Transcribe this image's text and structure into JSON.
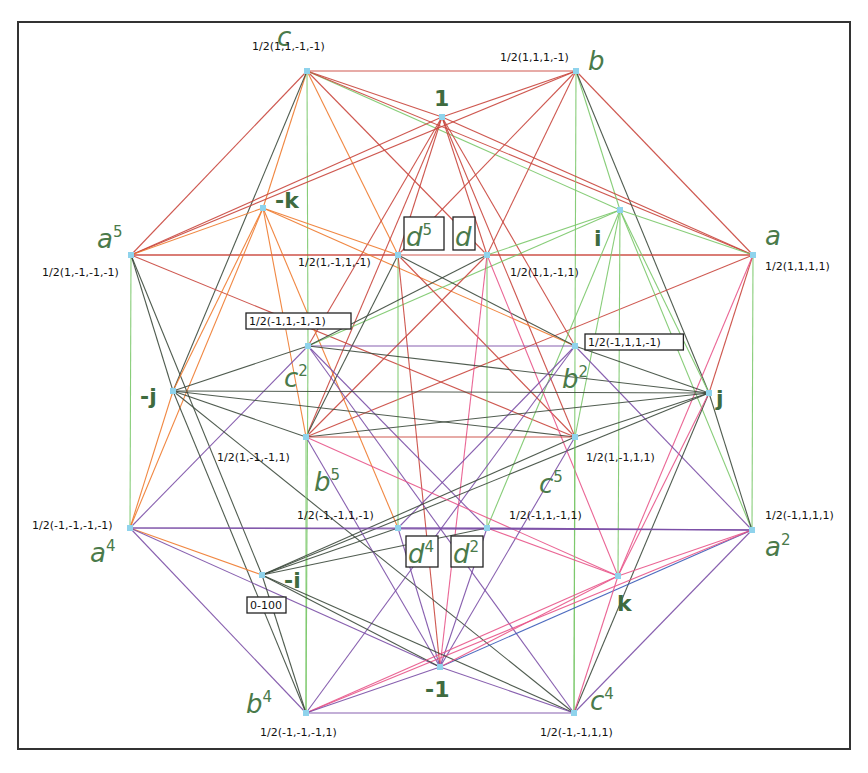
{
  "diagram": {
    "title": "",
    "frame": {
      "x": 18,
      "y": 22,
      "w": 832,
      "h": 727
    },
    "colors": {
      "node": "#8fd3ec",
      "label_green": "#4a7a4a",
      "red": "#c9463d",
      "orange": "#ee7a2e",
      "green": "#7bc86a",
      "dark": "#3d4a3d",
      "purple": "#7b4fa6",
      "pink": "#e8558a",
      "blue": "#3a5bb8",
      "brown": "#8a4a3a"
    },
    "nodes": [
      {
        "id": "c",
        "x": 307,
        "y": 71,
        "symbol": "c",
        "sup": "",
        "coord": "1/2(1,1,-1,-1)",
        "sx": 277,
        "sy": 46,
        "cx": 252,
        "cy": 50,
        "bold": false,
        "boxed": false
      },
      {
        "id": "b",
        "x": 576,
        "y": 71,
        "symbol": "b",
        "sup": "",
        "coord": "1/2(1,1,1,-1)",
        "sx": 588,
        "sy": 70,
        "cx": 500,
        "cy": 61,
        "bold": false,
        "boxed": false
      },
      {
        "id": "one",
        "x": 442,
        "y": 117,
        "symbol": "1",
        "sup": "",
        "coord": "",
        "sx": 434,
        "sy": 106,
        "cx": 0,
        "cy": 0,
        "bold": true,
        "boxed": false
      },
      {
        "id": "a5",
        "x": 131,
        "y": 255,
        "symbol": "a",
        "sup": "5",
        "coord": "1/2(1,-1,-1,-1)",
        "sx": 97,
        "sy": 248,
        "cx": 42,
        "cy": 276,
        "bold": false,
        "boxed": false
      },
      {
        "id": "a",
        "x": 753,
        "y": 255,
        "symbol": "a",
        "sup": "",
        "coord": "1/2(1,1,1,1)",
        "sx": 765,
        "sy": 245,
        "cx": 765,
        "cy": 270,
        "bold": false,
        "boxed": false
      },
      {
        "id": "nk",
        "x": 263,
        "y": 208,
        "symbol": "-k",
        "sup": "",
        "coord": "",
        "sx": 275,
        "sy": 208,
        "cx": 0,
        "cy": 0,
        "bold": true,
        "boxed": false
      },
      {
        "id": "i",
        "x": 620,
        "y": 210,
        "symbol": "i",
        "sup": "",
        "coord": "",
        "sx": 594,
        "sy": 246,
        "cx": 0,
        "cy": 0,
        "bold": true,
        "boxed": false
      },
      {
        "id": "d5",
        "x": 398,
        "y": 255,
        "symbol": "d",
        "sup": "5",
        "coord": "1/2(1,-1,1,-1)",
        "sx": 406,
        "sy": 246,
        "cx": 298,
        "cy": 266,
        "bold": false,
        "boxed": true,
        "bx": 404,
        "by": 217,
        "bw": 40,
        "bh": 33
      },
      {
        "id": "d",
        "x": 487,
        "y": 255,
        "symbol": "d",
        "sup": "",
        "coord": "1/2(1,1,-1,1)",
        "sx": 455,
        "sy": 246,
        "cx": 510,
        "cy": 276,
        "bold": false,
        "boxed": true,
        "bx": 453,
        "by": 217,
        "bw": 22,
        "bh": 33
      },
      {
        "id": "c2",
        "x": 308,
        "y": 346,
        "symbol": "c",
        "sup": "2",
        "coord": "1/2(-1,1,-1,-1)",
        "sx": 284,
        "sy": 387,
        "cx": 249,
        "cy": 325,
        "bold": false,
        "boxed": false,
        "coord_boxed": true
      },
      {
        "id": "b2",
        "x": 575,
        "y": 346,
        "symbol": "b",
        "sup": "2",
        "coord": "1/2(-1,1,1,-1)",
        "sx": 562,
        "sy": 388,
        "cx": 588,
        "cy": 346,
        "bold": false,
        "boxed": false,
        "coord_boxed": true
      },
      {
        "id": "nj",
        "x": 173,
        "y": 391,
        "symbol": "-j",
        "sup": "",
        "coord": "",
        "sx": 140,
        "sy": 404,
        "cx": 0,
        "cy": 0,
        "bold": true,
        "boxed": false
      },
      {
        "id": "j",
        "x": 709,
        "y": 393,
        "symbol": "j",
        "sup": "",
        "coord": "",
        "sx": 716,
        "sy": 406,
        "cx": 0,
        "cy": 0,
        "bold": true,
        "boxed": false
      },
      {
        "id": "b5",
        "x": 306,
        "y": 437,
        "symbol": "b",
        "sup": "5",
        "coord": "1/2(1,-1,-1,1)",
        "sx": 314,
        "sy": 491,
        "cx": 217,
        "cy": 461,
        "bold": false,
        "boxed": false
      },
      {
        "id": "c5",
        "x": 575,
        "y": 437,
        "symbol": "c",
        "sup": "5",
        "coord": "1/2(1,-1,1,1)",
        "sx": 539,
        "sy": 493,
        "cx": 586,
        "cy": 461,
        "bold": false,
        "boxed": false
      },
      {
        "id": "d4",
        "x": 398,
        "y": 528,
        "symbol": "d",
        "sup": "4",
        "coord": "1/2(-1,-1,1,-1)",
        "sx": 408,
        "sy": 563,
        "cx": 297,
        "cy": 519,
        "bold": false,
        "boxed": true,
        "bx": 406,
        "by": 536,
        "bw": 32,
        "bh": 31
      },
      {
        "id": "d2",
        "x": 487,
        "y": 528,
        "symbol": "d",
        "sup": "2",
        "coord": "1/2(-1,1,-1,1)",
        "sx": 453,
        "sy": 563,
        "cx": 509,
        "cy": 519,
        "bold": false,
        "boxed": true,
        "bx": 451,
        "by": 536,
        "bw": 32,
        "bh": 31
      },
      {
        "id": "a4",
        "x": 130,
        "y": 528,
        "symbol": "a",
        "sup": "4",
        "coord": "1/2(-1,-1,-1,-1)",
        "sx": 90,
        "sy": 562,
        "cx": 32,
        "cy": 529,
        "bold": false,
        "boxed": false
      },
      {
        "id": "a2",
        "x": 752,
        "y": 530,
        "symbol": "a",
        "sup": "2",
        "coord": "1/2(-1,1,1,1)",
        "sx": 765,
        "sy": 556,
        "cx": 765,
        "cy": 519,
        "bold": false,
        "boxed": false
      },
      {
        "id": "ni",
        "x": 262,
        "y": 575,
        "symbol": "-i",
        "sup": "",
        "coord": "0-100",
        "sx": 284,
        "sy": 588,
        "cx": 250,
        "cy": 609,
        "bold": true,
        "boxed": false,
        "coord_boxed": true
      },
      {
        "id": "k",
        "x": 618,
        "y": 576,
        "symbol": "k",
        "sup": "",
        "coord": "",
        "sx": 617,
        "sy": 611,
        "cx": 0,
        "cy": 0,
        "bold": true,
        "boxed": false
      },
      {
        "id": "n1",
        "x": 440,
        "y": 667,
        "symbol": "-1",
        "sup": "",
        "coord": "",
        "sx": 425,
        "sy": 697,
        "cx": 0,
        "cy": 0,
        "bold": true,
        "boxed": false
      },
      {
        "id": "b4",
        "x": 306,
        "y": 713,
        "symbol": "b",
        "sup": "4",
        "coord": "1/2(-1,-1,-1,1)",
        "sx": 246,
        "sy": 713,
        "cx": 260,
        "cy": 736,
        "bold": false,
        "boxed": false
      },
      {
        "id": "c4",
        "x": 574,
        "y": 713,
        "symbol": "c",
        "sup": "4",
        "coord": "1/2(-1,-1,1,1)",
        "sx": 590,
        "sy": 710,
        "cx": 540,
        "cy": 736,
        "bold": false,
        "boxed": false
      }
    ],
    "edges": [
      [
        "c",
        "b",
        "red"
      ],
      [
        "c",
        "one",
        "red"
      ],
      [
        "c",
        "a5",
        "red"
      ],
      [
        "c",
        "nk",
        "orange"
      ],
      [
        "c",
        "c2",
        "green"
      ],
      [
        "c",
        "i",
        "green"
      ],
      [
        "c",
        "a",
        "red"
      ],
      [
        "c",
        "d",
        "red"
      ],
      [
        "c",
        "nj",
        "dark"
      ],
      [
        "c",
        "d5",
        "orange"
      ],
      [
        "b",
        "one",
        "red"
      ],
      [
        "b",
        "a",
        "red"
      ],
      [
        "b",
        "i",
        "green"
      ],
      [
        "b",
        "b2",
        "green"
      ],
      [
        "b",
        "j",
        "dark"
      ],
      [
        "b",
        "a5",
        "red"
      ],
      [
        "b",
        "d5",
        "red"
      ],
      [
        "b",
        "d",
        "red"
      ],
      [
        "one",
        "a5",
        "red"
      ],
      [
        "one",
        "a",
        "red"
      ],
      [
        "one",
        "d5",
        "red"
      ],
      [
        "one",
        "d",
        "red"
      ],
      [
        "one",
        "c2",
        "red"
      ],
      [
        "one",
        "b2",
        "red"
      ],
      [
        "one",
        "b5",
        "red"
      ],
      [
        "one",
        "c5",
        "red"
      ],
      [
        "a5",
        "a",
        "red"
      ],
      [
        "a5",
        "nk",
        "orange"
      ],
      [
        "a5",
        "a4",
        "green"
      ],
      [
        "a5",
        "nj",
        "dark"
      ],
      [
        "a5",
        "ni",
        "dark"
      ],
      [
        "a5",
        "c5",
        "red"
      ],
      [
        "a5",
        "d5",
        "red"
      ],
      [
        "a",
        "i",
        "green"
      ],
      [
        "a",
        "a2",
        "green"
      ],
      [
        "a",
        "j",
        "red"
      ],
      [
        "a",
        "k",
        "pink"
      ],
      [
        "a",
        "b5",
        "red"
      ],
      [
        "a",
        "d",
        "red"
      ],
      [
        "nk",
        "b2",
        "orange"
      ],
      [
        "nk",
        "d5",
        "orange"
      ],
      [
        "nk",
        "nj",
        "orange"
      ],
      [
        "nk",
        "a4",
        "orange"
      ],
      [
        "nk",
        "d4",
        "orange"
      ],
      [
        "nk",
        "b5",
        "orange"
      ],
      [
        "i",
        "c2",
        "green"
      ],
      [
        "i",
        "d",
        "green"
      ],
      [
        "i",
        "j",
        "green"
      ],
      [
        "i",
        "a2",
        "green"
      ],
      [
        "i",
        "k",
        "green"
      ],
      [
        "i",
        "c5",
        "green"
      ],
      [
        "i",
        "d2",
        "green"
      ],
      [
        "d5",
        "b2",
        "dark"
      ],
      [
        "d5",
        "c5",
        "red"
      ],
      [
        "d5",
        "d4",
        "green"
      ],
      [
        "d5",
        "b5",
        "dark"
      ],
      [
        "d5",
        "n1",
        "red"
      ],
      [
        "d",
        "c2",
        "dark"
      ],
      [
        "d",
        "b5",
        "red"
      ],
      [
        "d",
        "d2",
        "green"
      ],
      [
        "d",
        "n1",
        "pink"
      ],
      [
        "d",
        "k",
        "pink"
      ],
      [
        "c2",
        "b2",
        "purple"
      ],
      [
        "c2",
        "nj",
        "dark"
      ],
      [
        "c2",
        "j",
        "dark"
      ],
      [
        "c2",
        "b4",
        "green"
      ],
      [
        "c2",
        "d2",
        "purple"
      ],
      [
        "c2",
        "a4",
        "purple"
      ],
      [
        "c2",
        "c4",
        "purple"
      ],
      [
        "b2",
        "j",
        "dark"
      ],
      [
        "b2",
        "c4",
        "green"
      ],
      [
        "b2",
        "d4",
        "purple"
      ],
      [
        "b2",
        "a2",
        "purple"
      ],
      [
        "b2",
        "b4",
        "purple"
      ],
      [
        "nj",
        "j",
        "dark"
      ],
      [
        "nj",
        "b5",
        "dark"
      ],
      [
        "nj",
        "c5",
        "dark"
      ],
      [
        "nj",
        "a4",
        "orange"
      ],
      [
        "nj",
        "c4",
        "dark"
      ],
      [
        "nj",
        "b4",
        "dark"
      ],
      [
        "j",
        "b5",
        "dark"
      ],
      [
        "j",
        "c5",
        "dark"
      ],
      [
        "j",
        "a2",
        "dark"
      ],
      [
        "j",
        "ni",
        "dark"
      ],
      [
        "j",
        "c4",
        "dark"
      ],
      [
        "j",
        "k",
        "pink"
      ],
      [
        "b5",
        "c5",
        "red"
      ],
      [
        "b5",
        "b4",
        "green"
      ],
      [
        "b5",
        "k",
        "pink"
      ],
      [
        "b5",
        "n1",
        "purple"
      ],
      [
        "c5",
        "c4",
        "green"
      ],
      [
        "c5",
        "ni",
        "dark"
      ],
      [
        "c5",
        "n1",
        "purple"
      ],
      [
        "d4",
        "d2",
        "purple"
      ],
      [
        "d4",
        "a4",
        "purple"
      ],
      [
        "d4",
        "ni",
        "dark"
      ],
      [
        "d4",
        "n1",
        "purple"
      ],
      [
        "d4",
        "a2",
        "purple"
      ],
      [
        "d2",
        "a2",
        "purple"
      ],
      [
        "d2",
        "k",
        "pink"
      ],
      [
        "d2",
        "n1",
        "purple"
      ],
      [
        "d2",
        "ni",
        "dark"
      ],
      [
        "a4",
        "ni",
        "orange"
      ],
      [
        "a4",
        "b4",
        "purple"
      ],
      [
        "a4",
        "n1",
        "purple"
      ],
      [
        "a4",
        "a2",
        "purple"
      ],
      [
        "a2",
        "k",
        "pink"
      ],
      [
        "a2",
        "n1",
        "blue"
      ],
      [
        "a2",
        "c4",
        "purple"
      ],
      [
        "a2",
        "b4",
        "pink"
      ],
      [
        "ni",
        "b4",
        "dark"
      ],
      [
        "ni",
        "n1",
        "dark"
      ],
      [
        "ni",
        "c4",
        "dark"
      ],
      [
        "k",
        "c4",
        "pink"
      ],
      [
        "k",
        "n1",
        "pink"
      ],
      [
        "k",
        "b4",
        "pink"
      ],
      [
        "n1",
        "b4",
        "purple"
      ],
      [
        "n1",
        "c4",
        "purple"
      ],
      [
        "b4",
        "c4",
        "purple"
      ]
    ]
  }
}
